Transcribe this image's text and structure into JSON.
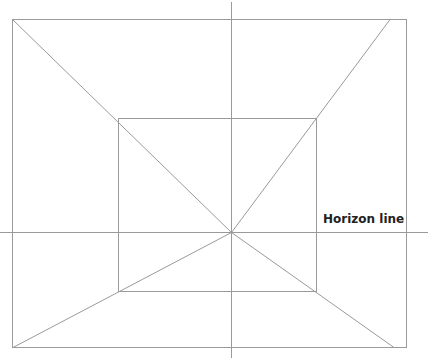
{
  "diagram": {
    "line_color": "#9a9a9a",
    "text_color": "#222222",
    "labels": {
      "horizon": "Horizon line"
    },
    "vanishing_point": {
      "x": 231,
      "y": 232
    },
    "outer_rect": {
      "x1": 12,
      "y1": 19,
      "x2": 407,
      "y2": 348
    },
    "inner_rect": {
      "x1": 118,
      "y1": 118,
      "x2": 317,
      "y2": 292
    },
    "horizon_line": {
      "x1": 0,
      "x2": 428,
      "y": 232
    },
    "vertical_line": {
      "x": 231,
      "y1": 2,
      "y2": 358
    },
    "orthogonals": [
      {
        "from": [
          12,
          19
        ],
        "to": [
          231,
          232
        ]
      },
      {
        "from": [
          390,
          20
        ],
        "to": [
          231,
          232
        ]
      },
      {
        "from": [
          13,
          348
        ],
        "to": [
          231,
          232
        ]
      },
      {
        "from": [
          394,
          348
        ],
        "to": [
          231,
          232
        ]
      }
    ]
  }
}
